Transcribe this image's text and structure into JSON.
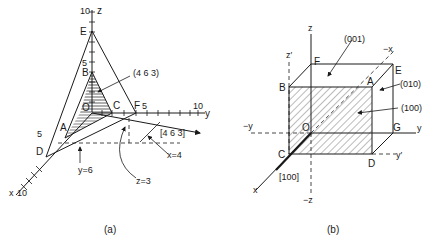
{
  "figure_a": {
    "caption": "(a)",
    "axis_labels": {
      "z": "z",
      "y": "y",
      "x": "x"
    },
    "tick_labels": {
      "z10": "10",
      "z5": "5",
      "y10": "10",
      "y5": "5",
      "x5": "5",
      "x10": "10"
    },
    "points": {
      "E": "E",
      "B": "B",
      "O": "O",
      "C": "C",
      "F": "F",
      "A": "A",
      "D": "D"
    },
    "plane_label": "(4 6 3)",
    "direction_label": "[4 6 3]",
    "annotations": {
      "x": "x=4",
      "y": "y=6",
      "z": "z=3"
    }
  },
  "figure_b": {
    "caption": "(b)",
    "axis_labels": {
      "z": "z",
      "z_prime": "z′",
      "minus_x": "−x",
      "minus_y": "−y",
      "y": "y",
      "y_prime": "y′",
      "x": "x",
      "minus_z": "−z"
    },
    "points": {
      "F": "F",
      "B": "B",
      "A": "A",
      "E": "E",
      "O": "O",
      "G": "G",
      "C": "C",
      "D": "D"
    },
    "plane_labels": {
      "p001": "(001)",
      "p010": "(010)",
      "p100": "(100)"
    },
    "direction_label": "[100]"
  },
  "colors": {
    "ink": "#1a1a1a",
    "background": "#ffffff"
  }
}
